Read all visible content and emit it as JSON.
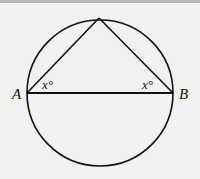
{
  "diagram": {
    "type": "circle-inscribed-triangle",
    "circle": {
      "cx": 100,
      "cy": 93,
      "r": 73
    },
    "points": {
      "A": {
        "label": "A",
        "x": 27,
        "y": 93
      },
      "B": {
        "label": "B",
        "x": 173,
        "y": 93
      },
      "apex": {
        "x": 99,
        "y": 18
      }
    },
    "angle_labels": {
      "at_A": "x°",
      "at_B": "x°"
    },
    "colors": {
      "stroke": "#111111",
      "background": "#f1f1ef",
      "top_bar": "#b8b8b6"
    }
  }
}
